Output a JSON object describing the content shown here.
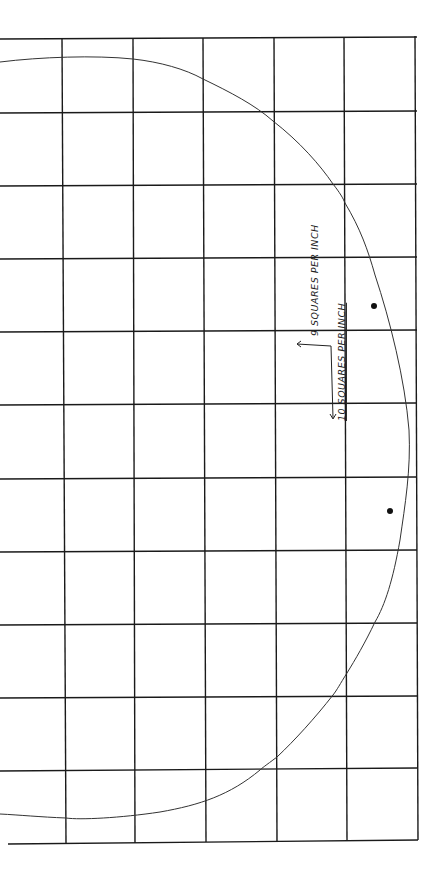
{
  "diagram": {
    "type": "pattern-grid",
    "grid": {
      "columns_x": [
        0,
        66,
        135,
        206,
        277,
        347,
        417
      ],
      "rows_y": [
        39,
        113,
        186,
        259,
        332,
        405,
        479,
        552,
        625,
        698,
        771,
        843
      ],
      "line_color": "#1a1a1a"
    },
    "curve": {
      "description": "half-ellipse pattern outline",
      "stroke": "#333333"
    },
    "marks": [
      {
        "name": "dot-upper",
        "x": 374,
        "y": 306
      },
      {
        "name": "dot-lower",
        "x": 390,
        "y": 511
      }
    ],
    "annotations": {
      "label_9": "9 SQUARES PER INCH",
      "label_10": "10 SQUARES PER INCH"
    }
  }
}
